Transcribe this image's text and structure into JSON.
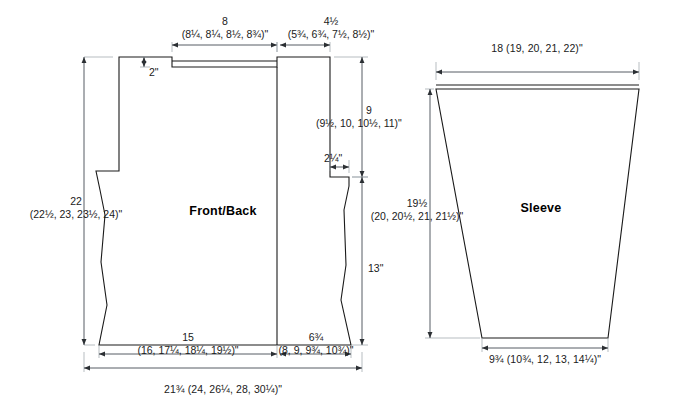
{
  "diagram": {
    "units": "inches",
    "line_color": "#1a1a1a",
    "dimension_color": "#444b52",
    "background": "#ffffff"
  },
  "pieces": {
    "front_back": {
      "label": "Front/Back",
      "dimensions": {
        "shoulder_width": {
          "primary": "8",
          "sizes": "(8¼, 8¼, 8½, 8¾)\""
        },
        "neck_width": {
          "primary": "4½",
          "sizes": "(5¾, 6¾, 7½, 8½)\""
        },
        "neck_depth": {
          "primary": "2\""
        },
        "total_length": {
          "primary": "22",
          "sizes": "(22½, 23, 23½, 24)\""
        },
        "armhole_depth": {
          "primary": "9",
          "sizes": "(9½, 10, 10½, 11)\""
        },
        "side_step": {
          "primary": "2¼\""
        },
        "side_length": {
          "primary": "13\""
        },
        "lower_left_width": {
          "primary": "15",
          "sizes": "(16, 17¼, 18¼, 19½)\""
        },
        "lower_right_width": {
          "primary": "6¾",
          "sizes": "(8, 9, 9¾, 10¾)\""
        },
        "total_bottom_width": {
          "primary": "21¾ (24, 26¼, 28, 30¼)\""
        }
      }
    },
    "sleeve": {
      "label": "Sleeve",
      "dimensions": {
        "upper_width": {
          "primary": "18 (19, 20, 21, 22)\""
        },
        "length": {
          "primary": "19½",
          "sizes": "(20, 20½, 21, 21½)\""
        },
        "cuff_width": {
          "primary": "9¾ (10¾, 12, 13, 14¼)\""
        }
      }
    }
  }
}
